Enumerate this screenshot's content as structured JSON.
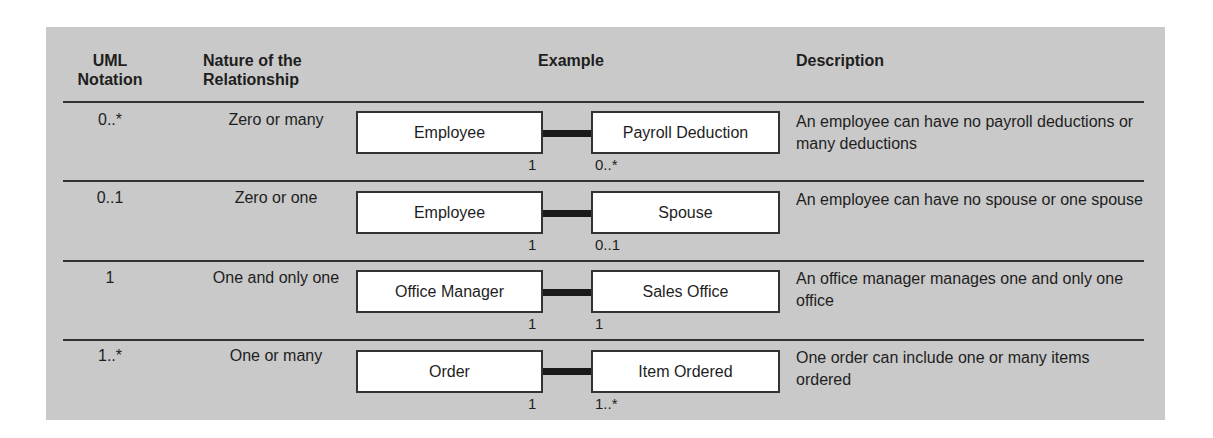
{
  "headers": {
    "uml_notation": [
      "UML",
      "Notation"
    ],
    "nature": [
      "Nature of the",
      "Relationship"
    ],
    "example": "Example",
    "description": "Description"
  },
  "rows": [
    {
      "notation": "0..*",
      "nature": "Zero or many",
      "left_entity": "Employee",
      "right_entity": "Payroll Deduction",
      "left_mult": "1",
      "right_mult": "0..*",
      "description": "An employee can have no payroll deductions or many deductions"
    },
    {
      "notation": "0..1",
      "nature": "Zero or one",
      "left_entity": "Employee",
      "right_entity": "Spouse",
      "left_mult": "1",
      "right_mult": "0..1",
      "description": "An employee can have no spouse or one spouse"
    },
    {
      "notation": "1",
      "nature": "One and only one",
      "left_entity": "Office Manager",
      "right_entity": "Sales Office",
      "left_mult": "1",
      "right_mult": "1",
      "description": "An office manager manages one and only one office"
    },
    {
      "notation": "1..*",
      "nature": "One or many",
      "left_entity": "Order",
      "right_entity": "Item Ordered",
      "left_mult": "1",
      "right_mult": "1..*",
      "description": "One order can include one or many items ordered"
    }
  ]
}
